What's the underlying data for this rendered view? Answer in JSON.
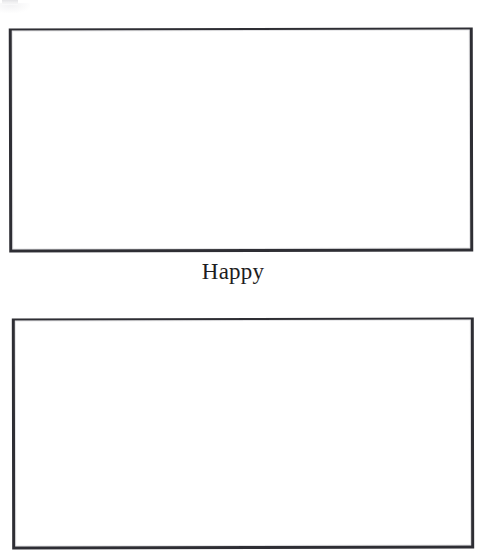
{
  "page": {
    "width": 483,
    "height": 556,
    "background_color": "#ffffff",
    "kind": "scanned-document-page"
  },
  "artifacts": {
    "top_left_smudge": {
      "name": "scan-smudge",
      "color": "#d9d9dd",
      "description": "faint light-gray scanner smudge at top-left edge"
    }
  },
  "figures": [
    {
      "id": "figure-1",
      "caption": "Happy",
      "content": "",
      "border_color": "#2e2e34",
      "x": 9,
      "y": 28,
      "width": 464,
      "height": 224
    },
    {
      "id": "figure-2",
      "caption": "",
      "content": "",
      "border_color": "#2e2e34",
      "x": 12,
      "y": 318,
      "width": 462,
      "height": 231
    }
  ]
}
